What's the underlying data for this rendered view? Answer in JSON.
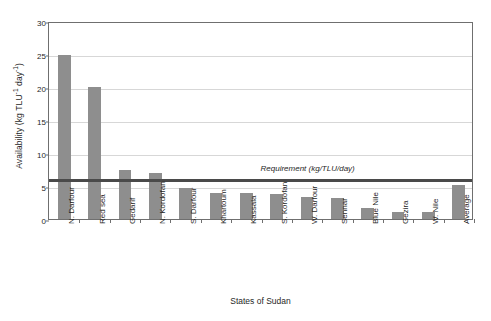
{
  "chart_data": {
    "type": "bar",
    "title": "",
    "subtitle": "",
    "xlabel": "States of Sudan",
    "ylabel": "Availability (kg TLU⁻¹ day⁻¹)",
    "ylabel_parts": {
      "prefix": "Availability (kg TLU",
      "sup1": "-1",
      "middle": " day",
      "sup2": "-1",
      "suffix": ")"
    },
    "categories": [
      "N. Darfour",
      "Red sea",
      "Gedarif",
      "N. Kordofan",
      "S. Darfour",
      "Khartoum",
      "Kassala",
      "S. Kordofan",
      "W. Darfour",
      "Sennar",
      "Blue Nile",
      "Gezira",
      "W. Nile",
      "Average"
    ],
    "values": [
      24.8,
      20.0,
      7.5,
      7.0,
      4.7,
      4.0,
      3.9,
      3.8,
      3.4,
      3.2,
      1.6,
      1.0,
      1.1,
      5.2
    ],
    "ylim": [
      0,
      30
    ],
    "yticks": [
      0,
      5,
      10,
      15,
      20,
      25,
      30
    ],
    "ytick_labels": [
      "0",
      "5",
      "10",
      "15",
      "20",
      "25",
      "30"
    ],
    "grid": true,
    "grid_axis": "y",
    "legend": "none",
    "bar_color": "#8e8e8e",
    "annotations": [
      {
        "type": "hline",
        "label": "Requirement (kg/TLU/day)",
        "value": 6.3,
        "color": "#4a4a4a"
      }
    ]
  }
}
